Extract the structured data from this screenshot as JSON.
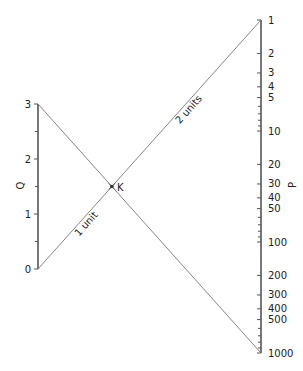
{
  "diagram": {
    "type": "nomogram",
    "left_axis": {
      "title": "Q",
      "scale": "linear",
      "min": 0,
      "max": 3,
      "major_ticks": [
        0,
        1,
        2,
        3
      ],
      "major_labels": [
        "0",
        "1",
        "2",
        "3"
      ],
      "minor_ticks": [
        0.5,
        1.5,
        2.5
      ]
    },
    "right_axis": {
      "title": "P",
      "scale": "log",
      "min": 1,
      "max": 1000,
      "labeled_ticks": [
        1,
        2,
        3,
        4,
        5,
        10,
        20,
        30,
        40,
        50,
        100,
        200,
        300,
        400,
        500,
        1000
      ],
      "labels": [
        "1",
        "2",
        "3",
        "4",
        "5",
        "10",
        "20",
        "30",
        "40",
        "50",
        "100",
        "200",
        "300",
        "400",
        "500",
        "1000"
      ],
      "minor_ticks": [
        6,
        7,
        8,
        9,
        60,
        70,
        80,
        90,
        600,
        700,
        800,
        900
      ]
    },
    "lines": [
      {
        "from": "Q=0",
        "to": "P=1",
        "label_lower": "1 unit",
        "label_upper": "2 units"
      },
      {
        "from": "Q=3",
        "to": "P=1000"
      }
    ],
    "point": {
      "label": "K",
      "q": 1.5
    }
  }
}
